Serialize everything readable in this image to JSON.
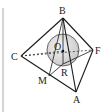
{
  "diagram": {
    "type": "geometry",
    "points": {
      "B": {
        "label": "B",
        "x": 63,
        "y": 18
      },
      "C": {
        "label": "C",
        "x": 21,
        "y": 56
      },
      "F": {
        "label": "F",
        "x": 93,
        "y": 50
      },
      "A": {
        "label": "A",
        "x": 76,
        "y": 92
      },
      "M": {
        "label": "M",
        "x": 49,
        "y": 76
      },
      "O": {
        "label": "O",
        "x": 63,
        "y": 51
      },
      "R": {
        "label": "R",
        "x": 62,
        "y": 65
      }
    },
    "sphere": {
      "center_label": "O",
      "cx": 63,
      "cy": 50,
      "r": 16
    },
    "solid_edges": [
      "BC",
      "BF",
      "BA",
      "CA",
      "FA",
      "BM",
      "BR",
      "MR",
      "RF"
    ],
    "dashed_edges": [
      "CF",
      "CO"
    ],
    "colors": {
      "line": "#1a1a1a",
      "sphere_fill": "#d9d9d9",
      "frame": "#aaaaaa"
    }
  }
}
